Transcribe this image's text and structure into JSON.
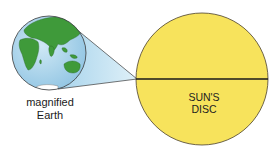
{
  "diagram": {
    "earth_label_line1": "magnified",
    "earth_label_line2": "Earth",
    "sun_label_line1": "SUN'S",
    "sun_label_line2": "DISC"
  },
  "colors": {
    "sun_fill": "#f7e35c",
    "ocean": "#a9d3ea",
    "land": "#3f9a3a",
    "cone": "#bfe0f0",
    "outline": "#3a3a3a"
  }
}
